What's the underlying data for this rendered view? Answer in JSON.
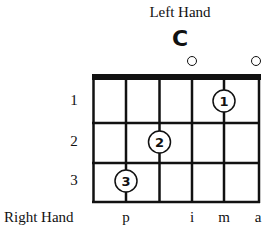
{
  "diagram": {
    "title": "Left Hand",
    "chord_name": "C",
    "strings": 6,
    "frets": 3,
    "open_strings": [
      4,
      6
    ],
    "fret_labels": [
      "1",
      "2",
      "3"
    ],
    "fingers": [
      {
        "finger": "1",
        "string": 5,
        "fret": 1
      },
      {
        "finger": "2",
        "string": 3,
        "fret": 2
      },
      {
        "finger": "3",
        "string": 2,
        "fret": 3
      }
    ],
    "right_hand": {
      "label": "Right Hand",
      "fingers": [
        {
          "label": "p",
          "string": 2
        },
        {
          "label": "i",
          "string": 4
        },
        {
          "label": "m",
          "string": 5
        },
        {
          "label": "a",
          "string": 6
        }
      ]
    }
  }
}
